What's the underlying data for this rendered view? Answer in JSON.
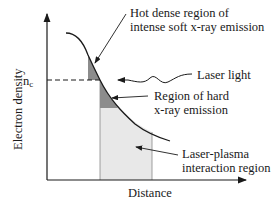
{
  "axes": {
    "ylabel": "Electron density",
    "xlabel": "Distance",
    "critical_density_label": "n",
    "critical_density_subscript": "c"
  },
  "annotations": {
    "hot_dense": {
      "line1": "Hot dense region of",
      "line2": "intense soft x-ray emission"
    },
    "laser": {
      "label": "Laser light"
    },
    "hard_xray": {
      "line1": "Region of hard",
      "line2": "x-ray emission"
    },
    "interaction": {
      "line1": "Laser-plasma",
      "line2": "interaction region"
    }
  },
  "colors": {
    "dark_region": "#8c8c8c",
    "light_region": "#e8e8e8",
    "line": "#1a1a1a"
  }
}
